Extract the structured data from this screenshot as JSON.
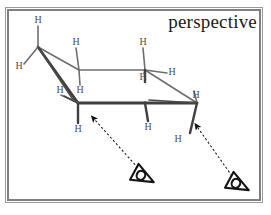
{
  "figure": {
    "title_label": "perspective",
    "frame_color": "#7f7f7f",
    "background": "#ffffff",
    "bond_color": "#6e6e6e",
    "bold_bond_color": "#3a3a3a",
    "atom_label_color": "#4d4d4d",
    "arrow_color": "#141414"
  },
  "molecule": {
    "name": "cyclohexane-chair-perspective",
    "carbon_count": 6,
    "hydrogen_labels": [
      {
        "id": "h-c1-axial-up",
        "text": "H",
        "x": 38,
        "y": 20
      },
      {
        "id": "h-c1-equatorial",
        "text": "H",
        "x": 19,
        "y": 66
      },
      {
        "id": "h-c2-axial-up",
        "text": "H",
        "x": 76,
        "y": 42
      },
      {
        "id": "h-c2-down",
        "text": "H",
        "x": 80,
        "y": 90
      },
      {
        "id": "h-c3-axial-up",
        "text": "H",
        "x": 143,
        "y": 42
      },
      {
        "id": "h-c3-equatorial",
        "text": "H",
        "x": 172,
        "y": 72
      },
      {
        "id": "h-c3-down",
        "text": "H",
        "x": 143,
        "y": 77
      },
      {
        "id": "h-c6-equatorial",
        "text": "H",
        "x": 60,
        "y": 90
      },
      {
        "id": "h-c6-axial-down",
        "text": "H",
        "x": 78,
        "y": 129
      },
      {
        "id": "h-c5-axial-down",
        "text": "H",
        "x": 148,
        "y": 127
      },
      {
        "id": "h-c4-equatorial",
        "text": "H",
        "x": 196,
        "y": 95
      },
      {
        "id": "h-c4-axial-down",
        "text": "H",
        "x": 178,
        "y": 139
      }
    ]
  },
  "viewpoints": [
    {
      "id": "eye-front-left",
      "label": "eye-symbol",
      "x": 144,
      "y": 177
    },
    {
      "id": "eye-front-right",
      "label": "eye-symbol",
      "x": 239,
      "y": 185
    }
  ],
  "sightlines": [
    {
      "id": "sightline-left",
      "from_x": 138,
      "from_y": 168,
      "to_x": 92,
      "to_y": 117
    },
    {
      "id": "sightline-right",
      "from_x": 232,
      "from_y": 176,
      "to_x": 195,
      "to_y": 125
    }
  ],
  "chart_data": {
    "type": "diagram",
    "title": "perspective",
    "ring_vertices": [
      {
        "id": "C1",
        "x": 38,
        "y": 47
      },
      {
        "id": "C2",
        "x": 79,
        "y": 70
      },
      {
        "id": "C3",
        "x": 145,
        "y": 70
      },
      {
        "id": "C4",
        "x": 197,
        "y": 103
      },
      {
        "id": "C5",
        "x": 145,
        "y": 103
      },
      {
        "id": "C6",
        "x": 78,
        "y": 103
      }
    ],
    "ring_bonds": [
      {
        "from": "C1",
        "to": "C2",
        "style": "thin"
      },
      {
        "from": "C2",
        "to": "C3",
        "style": "thin"
      },
      {
        "from": "C3",
        "to": "C4",
        "style": "thin"
      },
      {
        "from": "C4",
        "to": "C5",
        "style": "bold"
      },
      {
        "from": "C5",
        "to": "C6",
        "style": "bold"
      },
      {
        "from": "C6",
        "to": "C1",
        "style": "bold"
      }
    ]
  }
}
